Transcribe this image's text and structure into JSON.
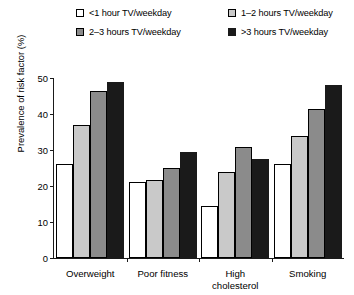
{
  "chart_data": {
    "type": "bar",
    "title": "",
    "subtitle": "",
    "xlabel": "",
    "ylabel": "Prevalence of risk factor (%)",
    "ylim": [
      0,
      50
    ],
    "yticks": [
      0,
      10,
      20,
      30,
      40,
      50
    ],
    "ytick_labels": [
      "0",
      "10",
      "20",
      "30",
      "40",
      "50"
    ],
    "grid": false,
    "legend_position": "top",
    "categories": [
      "Overweight",
      "Poor fitness",
      "High cholesterol",
      "Smoking"
    ],
    "category_label_lines": [
      [
        "Overweight"
      ],
      [
        "Poor fitness"
      ],
      [
        "High",
        "cholesterol"
      ],
      [
        "Smoking"
      ]
    ],
    "series": [
      {
        "name": "<1 hour TV/weekday",
        "color": "#ffffff",
        "values": [
          26,
          21,
          14.5,
          26
        ]
      },
      {
        "name": "1–2 hours TV/weekday",
        "color": "#c9c9c9",
        "values": [
          37,
          21.8,
          24,
          34
        ]
      },
      {
        "name": "2–3 hours TV/weekday",
        "color": "#8b8b8b",
        "values": [
          46.5,
          25,
          30.8,
          41.5
        ]
      },
      {
        "name": ">3 hours TV/weekday",
        "color": "#1a1a1a",
        "values": [
          49,
          29.5,
          27.5,
          48
        ]
      }
    ]
  },
  "legend": {
    "items": [
      {
        "label": "<1 hour TV/weekday",
        "color": "#ffffff"
      },
      {
        "label": "1–2 hours TV/weekday",
        "color": "#c9c9c9"
      },
      {
        "label": "2–3 hours TV/weekday",
        "color": "#8b8b8b"
      },
      {
        "label": ">3 hours TV/weekday",
        "color": "#1a1a1a"
      }
    ]
  }
}
